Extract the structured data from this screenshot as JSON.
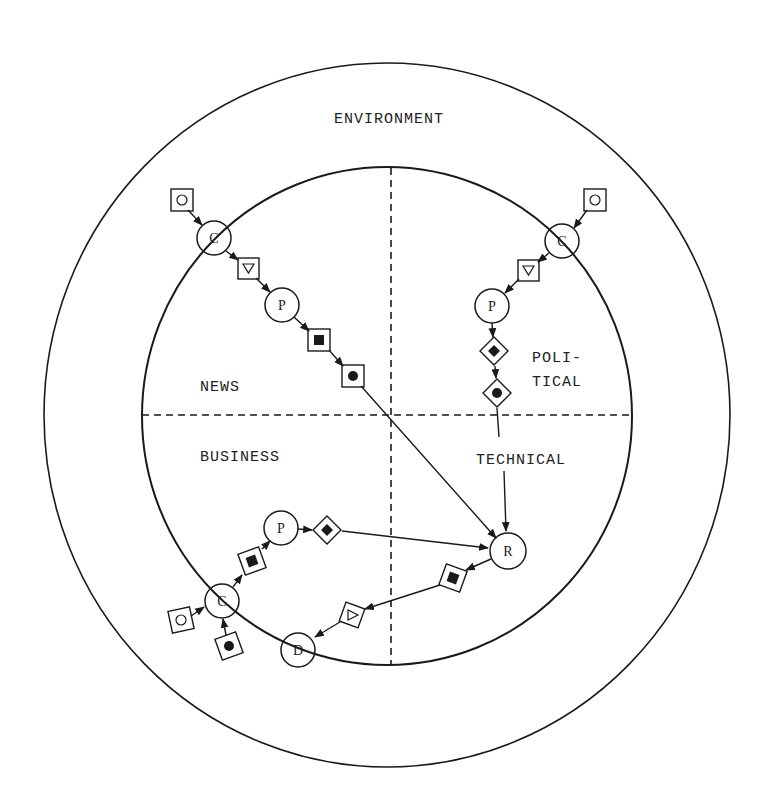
{
  "colors": {
    "ink": "#1a1a1a",
    "background": "#ffffff"
  },
  "regions": {
    "environment": "ENVIRONMENT",
    "news": "NEWS",
    "political_line1": "POLI-",
    "political_line2": "TICAL",
    "business": "BUSINESS",
    "technical": "TECHNICAL"
  },
  "geometry": {
    "outer_circle": {
      "cx": 387,
      "cy": 415,
      "rx": 343,
      "ry": 352
    },
    "inner_circle": {
      "cx": 387,
      "cy": 416,
      "rx": 245,
      "ry": 249
    },
    "vertical_divider_x": 391,
    "horizontal_divider_y": 415
  },
  "legend_symbols": {
    "square_open_circle": "input (open circle in square)",
    "square_triangle": "down-triangle in square",
    "square_filled_square": "filled square in square",
    "square_filled_circle": "filled circle in square",
    "diamond_filled_diamond": "filled diamond in diamond",
    "diamond_filled_circle": "filled circle in diamond"
  },
  "nodes": {
    "news_c": {
      "letter": "C",
      "x": 214,
      "y": 238
    },
    "news_p": {
      "letter": "P",
      "x": 282,
      "y": 305
    },
    "political_c": {
      "letter": "C",
      "x": 562,
      "y": 241
    },
    "political_p": {
      "letter": "P",
      "x": 492,
      "y": 306
    },
    "business_p": {
      "letter": "P",
      "x": 281,
      "y": 528
    },
    "business_c": {
      "letter": "C",
      "x": 222,
      "y": 601
    },
    "business_d": {
      "letter": "D",
      "x": 298,
      "y": 650
    },
    "r": {
      "letter": "R",
      "x": 508,
      "y": 551
    }
  },
  "diagram_data": {
    "title": "",
    "regions": [
      "ENVIRONMENT",
      "NEWS",
      "POLITICAL",
      "BUSINESS",
      "TECHNICAL"
    ],
    "flows": [
      {
        "region": "NEWS",
        "path": [
          "O-square",
          "C",
          "triangle-square",
          "P",
          "filled-square-square",
          "filled-circle-square",
          "R"
        ]
      },
      {
        "region": "POLITICAL",
        "path": [
          "O-square",
          "C",
          "triangle-square",
          "P",
          "filled-diamond-diamond",
          "filled-circle-diamond",
          "TECHNICAL"
        ]
      },
      {
        "region": "TECHNICAL",
        "path": [
          "TECHNICAL",
          "R"
        ]
      },
      {
        "region": "BUSINESS",
        "path": [
          "O-square",
          "C",
          "filled-square-diamond",
          "P",
          "filled-diamond-diamond",
          "R"
        ]
      },
      {
        "region": "BUSINESS",
        "path": [
          "R",
          "filled-square-diamond",
          "triangle-diamond",
          "D"
        ]
      },
      {
        "region": "BUSINESS",
        "path": [
          "filled-circle-diamond",
          "C"
        ]
      }
    ]
  }
}
